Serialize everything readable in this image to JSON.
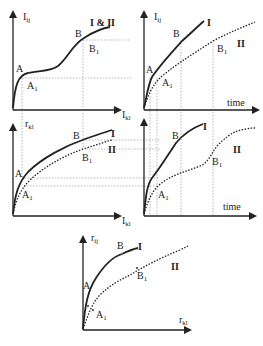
{
  "panels": {
    "top_left": {
      "y_axis": "I",
      "y_sub": "ij",
      "x_axis": "I",
      "x_sub": "kl",
      "curve_label": "I & II",
      "points": {
        "A": "A",
        "A1": "A",
        "A1_sub": "1",
        "B": "B",
        "B1": "B",
        "B1_sub": "1"
      }
    },
    "top_right": {
      "y_axis": "I",
      "y_sub": "ij",
      "x_axis": "time",
      "curve_I": "I",
      "curve_II": "II",
      "points": {
        "A": "A",
        "A1": "A",
        "A1_sub": "1",
        "B": "B",
        "B1": "B",
        "B1_sub": "1"
      }
    },
    "middle_left": {
      "y_axis": "r",
      "y_sub": "kl",
      "x_axis": "I",
      "x_sub": "kl",
      "curve_I": "I",
      "curve_II": "II",
      "points": {
        "A": "A",
        "A1": "A",
        "A1_sub": "1",
        "B": "B",
        "B1": "B",
        "B1_sub": "1"
      }
    },
    "middle_right": {
      "x_axis": "time",
      "curve_I": "I",
      "curve_II": "II",
      "points": {
        "A1": "A",
        "A1_sub": "1",
        "B": "B",
        "B1": "B",
        "B1_sub": "1"
      }
    },
    "bottom": {
      "y_axis": "r",
      "y_sub": "ij",
      "x_axis": "r",
      "x_sub": "kl",
      "curve_I": "I",
      "curve_II": "II",
      "points": {
        "A": "A",
        "A1": "A",
        "A1_sub": "1",
        "B": "B",
        "B1": "B",
        "B1_sub": "1"
      }
    }
  },
  "colors": {
    "ink": "#222222",
    "guide": "#888888"
  }
}
